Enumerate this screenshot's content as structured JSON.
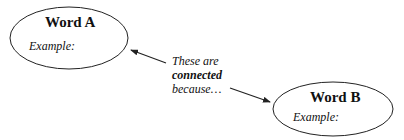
{
  "nodes": [
    {
      "id": "word-a",
      "title": "Word A",
      "example_label": "Example:"
    },
    {
      "id": "word-b",
      "title": "Word B",
      "example_label": "Example:"
    }
  ],
  "connector": {
    "line1": "These are",
    "line2": "connected",
    "line3": "because…"
  },
  "colors": {
    "stroke": "#222222",
    "text": "#111111",
    "background": "#ffffff"
  }
}
